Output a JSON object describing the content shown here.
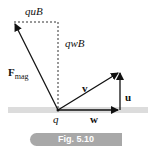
{
  "figure": {
    "caption": "Fig. 5.10",
    "labels": {
      "quB": "quB",
      "qwB": "qwB",
      "F_main": "F",
      "F_sub": "mag",
      "v": "v",
      "u": "u",
      "w": "w",
      "q": "q"
    },
    "colors": {
      "band": "#dcdcdc",
      "lines": "#111111",
      "pill": "#a8a8a8",
      "pill_text": "#ffffff"
    }
  }
}
